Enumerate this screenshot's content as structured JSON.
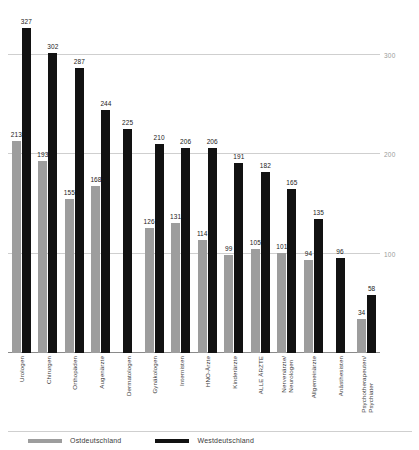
{
  "chart_data": {
    "type": "bar",
    "title": "",
    "xlabel": "",
    "ylabel": "",
    "ylim": [
      0,
      345
    ],
    "grid": true,
    "gridlines": [
      100,
      200,
      300
    ],
    "ytick_labels": [
      "100",
      "200",
      "300"
    ],
    "legend_position": "bottom-left",
    "categories": [
      "Urologen",
      "Chirurgen",
      "Orthopäden",
      "Augenärzte",
      "Dermatologen",
      "Gynäkologen",
      "Internisten",
      "HNO-Ärzte",
      "Kinderärzte",
      "ALLE ÄRZTE",
      "Nervenärzte/\nNeurologen",
      "Allgemeinärzte",
      "Anästhesisten",
      "Psychotherapeuten/\nPsychiater"
    ],
    "series": [
      {
        "name": "Ostdeutschland",
        "color": "#9d9d9d",
        "values": [
          213,
          193,
          155,
          168,
          null,
          126,
          131,
          114,
          99,
          105,
          101,
          94,
          null,
          34
        ]
      },
      {
        "name": "Westdeutschland",
        "color": "#121212",
        "values": [
          327,
          302,
          287,
          244,
          225,
          210,
          206,
          206,
          191,
          182,
          165,
          135,
          96,
          58
        ]
      }
    ]
  },
  "legend": {
    "items": [
      {
        "label": "Ostdeutschland",
        "color": "#9d9d9d"
      },
      {
        "label": "Westdeutschland",
        "color": "#121212"
      }
    ]
  }
}
